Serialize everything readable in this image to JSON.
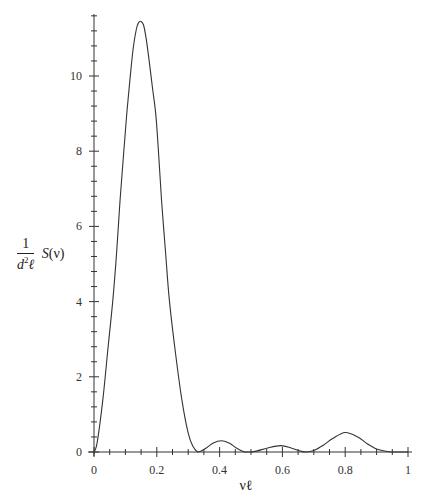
{
  "chart_data": {
    "type": "line",
    "title": "",
    "xlabel": "νℓ",
    "ylabel": {
      "numerator": "1",
      "denominator_base": "d",
      "denominator_sup": "2",
      "denominator_tail": "ℓ",
      "function": "S",
      "argument": "(ν)"
    },
    "xlim": [
      0,
      1
    ],
    "ylim": [
      0,
      11.6
    ],
    "x_ticks": [
      0,
      0.2,
      0.4,
      0.6,
      0.8,
      1
    ],
    "x_tick_labels": [
      "0",
      "0.2",
      "0.4",
      "0.6",
      "0.8",
      "1"
    ],
    "x_minor_step": 0.05,
    "y_ticks": [
      0,
      2,
      4,
      6,
      8,
      10
    ],
    "y_tick_labels": [
      "0",
      "2",
      "4",
      "6",
      "8",
      "10"
    ],
    "y_minor_step": 0.4,
    "grid": false,
    "legend": null,
    "series": [
      {
        "name": "S(ν)/(d²ℓ)",
        "x": [
          0,
          0.01,
          0.028,
          0.045,
          0.06,
          0.072,
          0.083,
          0.094,
          0.104,
          0.115,
          0.125,
          0.135,
          0.142,
          0.15,
          0.158,
          0.166,
          0.175,
          0.186,
          0.197,
          0.206,
          0.215,
          0.228,
          0.24,
          0.26,
          0.28,
          0.3,
          0.315,
          0.33,
          0.34,
          0.36,
          0.38,
          0.405,
          0.43,
          0.455,
          0.48,
          0.5,
          0.52,
          0.55,
          0.595,
          0.63,
          0.66,
          0.675,
          0.7,
          0.73,
          0.76,
          0.8,
          0.84,
          0.87,
          0.9,
          0.93,
          0.95,
          0.975,
          1.0
        ],
        "y": [
          0,
          0.25,
          1.38,
          2.8,
          4.04,
          5.3,
          6.7,
          7.9,
          8.96,
          9.95,
          10.75,
          11.25,
          11.42,
          11.45,
          11.35,
          11.0,
          10.45,
          9.7,
          8.96,
          7.9,
          6.7,
          5.3,
          4.04,
          2.6,
          1.38,
          0.5,
          0.15,
          0.0,
          0.02,
          0.12,
          0.24,
          0.3,
          0.24,
          0.1,
          0.0,
          0.0,
          0.03,
          0.1,
          0.17,
          0.1,
          0.02,
          0.0,
          0.04,
          0.18,
          0.36,
          0.52,
          0.4,
          0.22,
          0.08,
          0.02,
          0.0,
          0.0,
          0.0
        ]
      }
    ],
    "annotations": []
  },
  "layout": {
    "origin_px": [
      94,
      452
    ],
    "x_scale_px_per_unit": 314,
    "y_scale_px_per_unit": 37.6,
    "x_axis_end_px": 412,
    "y_axis_top_px": 14,
    "line_color": "#333333",
    "axis_color": "#333333"
  }
}
